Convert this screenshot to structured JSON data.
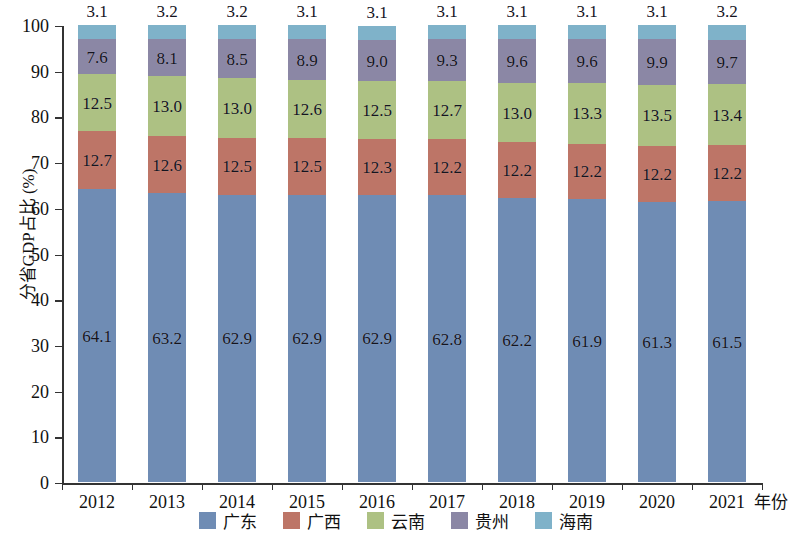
{
  "chart_data": {
    "type": "bar",
    "subtype": "stacked-100-percent",
    "title": "",
    "xlabel": "年份",
    "ylabel": "分省GDP占比 (%)",
    "ylim": [
      0,
      100
    ],
    "y_ticks": [
      0,
      10,
      20,
      30,
      40,
      50,
      60,
      70,
      80,
      90,
      100
    ],
    "grid": false,
    "legend_position": "bottom-center",
    "categories": [
      "2012",
      "2013",
      "2014",
      "2015",
      "2016",
      "2017",
      "2018",
      "2019",
      "2020",
      "2021"
    ],
    "series": [
      {
        "name": "广东",
        "color": "#6f8cb4",
        "values": [
          64.1,
          63.2,
          62.9,
          62.9,
          62.9,
          62.8,
          62.2,
          61.9,
          61.3,
          61.5
        ],
        "labels": [
          "64.1",
          "63.2",
          "62.9",
          "62.9",
          "62.9",
          "62.8",
          "62.2",
          "61.9",
          "61.3",
          "61.5"
        ]
      },
      {
        "name": "广西",
        "color": "#bd7567",
        "values": [
          12.7,
          12.6,
          12.5,
          12.5,
          12.3,
          12.2,
          12.2,
          12.2,
          12.2,
          12.2
        ],
        "labels": [
          "12.7",
          "12.6",
          "12.5",
          "12.5",
          "12.3",
          "12.2",
          "12.2",
          "12.2",
          "12.2",
          "12.2"
        ]
      },
      {
        "name": "云南",
        "color": "#adc183",
        "values": [
          12.5,
          13.0,
          13.0,
          12.6,
          12.5,
          12.7,
          13.0,
          13.3,
          13.5,
          13.4
        ],
        "labels": [
          "12.5",
          "13.0",
          "13.0",
          "12.6",
          "12.5",
          "12.7",
          "13.0",
          "13.3",
          "13.5",
          "13.4"
        ]
      },
      {
        "name": "贵州",
        "color": "#8b87a5",
        "values": [
          7.6,
          8.1,
          8.5,
          8.9,
          9.0,
          9.3,
          9.6,
          9.6,
          9.9,
          9.7
        ],
        "labels": [
          "7.6",
          "8.1",
          "8.5",
          "8.9",
          "9.0",
          "9.3",
          "9.6",
          "9.6",
          "9.9",
          "9.7"
        ]
      },
      {
        "name": "海南",
        "color": "#7fb2c9",
        "values": [
          3.1,
          3.2,
          3.2,
          3.1,
          3.1,
          3.1,
          3.1,
          3.1,
          3.1,
          3.2
        ],
        "labels": [
          "3.1",
          "3.2",
          "3.2",
          "3.1",
          "3.1",
          "3.1",
          "3.1",
          "3.1",
          "3.1",
          "3.2"
        ]
      }
    ]
  }
}
